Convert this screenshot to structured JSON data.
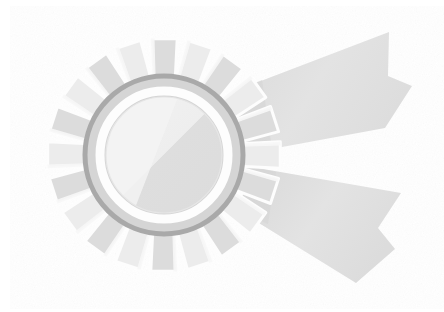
{
  "artwork": {
    "title": "Award Rosette Ribbon",
    "subject": "award-rosette",
    "style": "grayscale-flat-illustration",
    "background_color": "#ffffff",
    "canvas": {
      "width": 444,
      "height": 312
    }
  },
  "palette": {
    "background": "#ffffff",
    "ribbon_fill": "#e2e2e2",
    "ribbon_shadow": "#d6d6d6",
    "petal_fill": "#dcdcdc",
    "petal_light": "#ececec",
    "petal_gap": "#fdfdfd",
    "ring_outline": "#a8a8a8",
    "ring_fill": "#d2d2d2",
    "white_ring": "#fefefe",
    "center_light": "#f0f0f0",
    "center_shade": "#dedede"
  },
  "rosette": {
    "label": "rosette-badge",
    "center_x": 164,
    "center_y": 155,
    "petal_count": 20,
    "petal_outer_radius": 117,
    "petal_inner_radius": 76,
    "outer_ring_radius": 79,
    "outer_ring_stroke": 5,
    "white_ring_radius": 63,
    "white_ring_stroke": 8,
    "center_disc_radius": 58
  },
  "ribbons": [
    {
      "name": "ribbon-tail-upper",
      "direction": "upper-right",
      "points": "236,96 388,33 387,75 411,85 384,127 246,150",
      "notch": "387,75 411,85 384,127",
      "tip_x": 411,
      "tip_y": 85
    },
    {
      "name": "ribbon-tail-lower",
      "direction": "lower-right",
      "points": "248,169 399,194 377,227 393,247 355,281 245,210",
      "notch": "377,227 393,247 355,281",
      "tip_x": 393,
      "tip_y": 247
    }
  ],
  "center_highlight": {
    "name": "diagonal-shading-split",
    "from_angle_deg": 285,
    "to_angle_deg": 105,
    "light_side": "upper-left",
    "shade_side": "lower-right"
  }
}
